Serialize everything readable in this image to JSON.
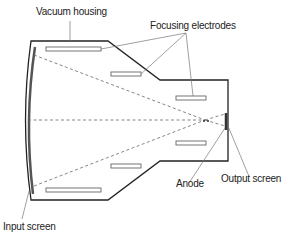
{
  "labels": {
    "vacuum_housing": "Vacuum housing",
    "focusing_electrodes": "Focusing electrodes",
    "anode": "Anode",
    "output_screen": "Output screen",
    "input_screen": "Input screen"
  },
  "colors": {
    "outline": "#222222",
    "screen": "#555555",
    "electrode_stroke": "#666666",
    "dashed": "#666666",
    "leader": "#777777"
  }
}
